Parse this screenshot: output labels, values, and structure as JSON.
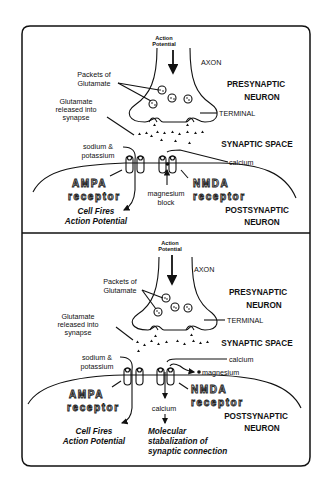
{
  "diagram": {
    "panels": [
      {
        "id": "panel-1",
        "labels": {
          "action_potential_line1": "Action",
          "action_potential_line2": "Potential",
          "axon": "AXON",
          "packets_line1": "Packets of",
          "packets_line2": "Glutamate",
          "presynaptic_line1": "PRESYNAPTIC",
          "presynaptic_line2": "NEURON",
          "glutamate_released_line1": "Glutamate",
          "glutamate_released_line2": "released  into",
          "glutamate_released_line3": "synapse",
          "terminal": "TERMINAL",
          "synaptic_space": "SYNAPTIC SPACE",
          "sodium_line1": "sodium  &",
          "sodium_line2": "potassium",
          "calcium": "calcium",
          "ampa_line1": "AMPA",
          "ampa_line2": "receptor",
          "magnesium_block_line1": "magnesium",
          "magnesium_block_line2": "block",
          "nmda_line1": "NMDA",
          "nmda_line2": "receptor",
          "cell_fires_line1": "Cell Fires",
          "cell_fires_line2": "Action Potential",
          "postsynaptic_line1": "POSTSYNAPTIC",
          "postsynaptic_line2": "NEURON"
        }
      },
      {
        "id": "panel-2",
        "labels": {
          "action_potential_line1": "Action",
          "action_potential_line2": "Potential",
          "axon": "AXON",
          "packets_line1": "Packets of",
          "packets_line2": "Glutamate",
          "presynaptic_line1": "PRESYNAPTIC",
          "presynaptic_line2": "NEURON",
          "glutamate_released_line1": "Glutamate",
          "glutamate_released_line2": "released  into",
          "glutamate_released_line3": "synapse",
          "terminal": "TERMINAL",
          "synaptic_space": "SYNAPTIC SPACE",
          "sodium_line1": "sodium  &",
          "sodium_line2": "potassium",
          "calcium_in": "calcium",
          "magnesium": "magnesium",
          "ampa_line1": "AMPA",
          "ampa_line2": "receptor",
          "calcium_down": "calcium",
          "nmda_line1": "NMDA",
          "nmda_line2": "receptor",
          "cell_fires_line1": "Cell Fires",
          "cell_fires_line2": "Action Potential",
          "molecular_line1": "Molecular",
          "molecular_line2": "stabalization of",
          "molecular_line3": "synaptic connection",
          "postsynaptic_line1": "POSTSYNAPTIC",
          "postsynaptic_line2": "NEURON"
        }
      }
    ]
  }
}
